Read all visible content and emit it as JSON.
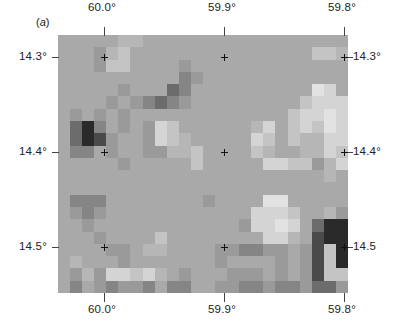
{
  "figure": {
    "panel_label": "a",
    "top_axis": [
      {
        "label": "60.0°",
        "x": 104
      },
      {
        "label": "59.9°",
        "x": 224
      },
      {
        "label": "59.8°",
        "x": 344
      }
    ],
    "bottom_axis": [
      {
        "label": "60.0°",
        "x": 104
      },
      {
        "label": "59.9°",
        "x": 224
      },
      {
        "label": "59.8°",
        "x": 344
      }
    ],
    "left_axis": [
      {
        "label": "14.3°",
        "y": 57
      },
      {
        "label": "14.4°",
        "y": 152
      },
      {
        "label": "14.5°",
        "y": 247
      }
    ],
    "right_axis": [
      {
        "label": "14.3°",
        "y": 57
      },
      {
        "label": "14.4°",
        "y": 152
      },
      {
        "label": "14.5",
        "y": 247
      }
    ],
    "map_extent": {
      "left": 58,
      "top": 35,
      "right": 348,
      "bottom": 293
    },
    "background_gray": "#a8a8a8",
    "grid_cols": 24,
    "grid_rows": 21,
    "cells": [
      "aaaaabbaaaaaaaaaaaaaaaaa",
      "aaa9bcaaaaaaaaaaaaaaaccb",
      "aaa9ccaaaa9aaaaaaaaaaaaa",
      "aaaaaaaaaa89aaaaaaaaaaaa",
      "aaaaa9aaa78aaaaaaaaaaeda",
      "aaaa9a98789aaaaaaaaacddd",
      "a9a9a9aaaaaaaaaaaaacdded",
      "a758a9a9dcaaaaaabdacdced",
      "a7569aa9dcbaaaaadcacbbdd",
      "a88a9aa99bbcaaaacbaabbdc",
      "aaaaa9aaaaacaaaaaddcc9bd",
      "aaaaaaaaaaaaaaaaaaaaaaba",
      "aaaaaaaaaaaaaaaaaaaaaaaa",
      "a888aaaaaaaa9aaaaeeaaaaa",
      "a989aaaaaaaaaaaadddcaab9",
      "aa9aaaaaaaaaaaa9ddeda755",
      "aaa9aaaacaaaaaaaaddba655",
      "aaaa99abbaaaa998899a96c5",
      "abaaa9aaaaaaa9aaaa9a96c5",
      "a9b9ddcdba9aaa999a9a96cc",
      "a8a98998a88aa99889889779"
    ],
    "gray_scale": {
      "5": "#2a2a2a",
      "6": "#4a4a4a",
      "7": "#6c6c6c",
      "8": "#858585",
      "9": "#9a9a9a",
      "a": "#a9a9a9",
      "b": "#b6b6b6",
      "c": "#c4c4c4",
      "d": "#d4d4d4",
      "e": "#e2e2e2"
    }
  }
}
